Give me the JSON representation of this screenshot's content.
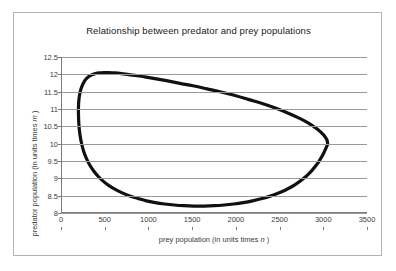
{
  "figure": {
    "title": "Relationship between predator and prey populations",
    "border_color": "#b4b4b4",
    "background": "#ffffff"
  },
  "axes": {
    "x": {
      "label_prefix": "prey population (in units times ",
      "label_symbol": "n",
      "label_suffix": " )",
      "ticks": [
        "0",
        "500",
        "1000",
        "1500",
        "2000",
        "2500",
        "3000",
        "3500"
      ],
      "min": 0,
      "max": 3500,
      "step": 500
    },
    "y": {
      "label_prefix": "predator population (in units times ",
      "label_symbol": "m",
      "label_suffix": " )",
      "ticks": [
        "12.5",
        "12",
        "11.5",
        "11",
        "10.5",
        "10",
        "9.5",
        "9",
        "8.5",
        "8"
      ],
      "min": 8,
      "max": 12.5,
      "step": 0.5
    }
  },
  "style": {
    "curve_color": "#111111",
    "curve_width_px": 3.2,
    "grid_color": "#9a9a9a",
    "axis_color": "#7a7a7a",
    "text_color": "#3c3c3c",
    "title_color": "#1a1a1a"
  },
  "chart_data": {
    "type": "line",
    "title": "Relationship between predator and prey populations",
    "xlabel": "prey population (in units times n )",
    "ylabel": "predator population (in units times m )",
    "xlim": [
      0,
      3500
    ],
    "ylim": [
      8,
      12.5
    ],
    "grid": "horizontal",
    "legend": "none",
    "closed_curve": true,
    "extrema": {
      "prey_min": 200,
      "prey_min_at_predator": 10.2,
      "prey_max": 3050,
      "prey_max_at_predator": 10.0,
      "predator_min": 8.2,
      "predator_min_at_prey": 900,
      "predator_max": 12.05,
      "predator_max_at_prey": 1000
    },
    "series": [
      {
        "name": "predator-prey orbit",
        "x": [
          3050,
          3040,
          3000,
          2930,
          2840,
          2730,
          2600,
          2460,
          2310,
          2150,
          1990,
          1830,
          1670,
          1510,
          1360,
          1220,
          1090,
          975,
          870,
          775,
          690,
          615,
          548,
          489,
          438,
          394,
          356,
          323,
          296,
          272,
          252,
          234,
          218,
          206,
          200,
          200,
          205,
          216,
          234,
          258,
          289,
          327,
          372,
          424,
          482,
          548,
          620,
          700,
          786,
          878,
          976,
          1078,
          1185,
          1295,
          1408,
          1522,
          1637,
          1752,
          1866,
          1977,
          2085,
          2190,
          2290,
          2385,
          2474,
          2557,
          2633,
          2703,
          2766,
          2822,
          2871,
          2914,
          2951,
          2982,
          3007,
          3027,
          3041,
          3049,
          3050
        ],
        "y": [
          10.0,
          10.12,
          10.26,
          10.42,
          10.58,
          10.73,
          10.88,
          11.02,
          11.15,
          11.27,
          11.39,
          11.49,
          11.58,
          11.67,
          11.74,
          11.81,
          11.87,
          11.92,
          11.96,
          11.99,
          12.02,
          12.04,
          12.05,
          12.05,
          12.04,
          12.02,
          11.99,
          11.95,
          11.89,
          11.82,
          11.73,
          11.62,
          11.48,
          11.3,
          11.08,
          10.82,
          10.54,
          10.27,
          10.02,
          9.79,
          9.58,
          9.39,
          9.22,
          9.06,
          8.92,
          8.79,
          8.68,
          8.58,
          8.49,
          8.42,
          8.35,
          8.3,
          8.26,
          8.23,
          8.21,
          8.2,
          8.2,
          8.21,
          8.23,
          8.26,
          8.3,
          8.35,
          8.41,
          8.48,
          8.56,
          8.65,
          8.75,
          8.86,
          8.98,
          9.1,
          9.23,
          9.36,
          9.49,
          9.62,
          9.74,
          9.85,
          9.93,
          9.98,
          10.0
        ]
      }
    ]
  }
}
